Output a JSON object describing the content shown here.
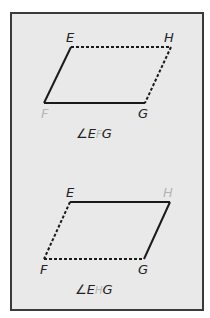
{
  "figures": [
    {
      "vertices": {
        "E": {
          "label": "E",
          "x": 71,
          "y": 47
        },
        "H": {
          "label": "H",
          "x": 171,
          "y": 47
        },
        "F": {
          "label": "F",
          "x": 44,
          "y": 103
        },
        "G": {
          "label": "G",
          "x": 145,
          "y": 103
        }
      },
      "solid_sides": [
        "EF",
        "FG"
      ],
      "dashed_sides": [
        "EH",
        "HG"
      ],
      "faded_vertex": "F",
      "angle_label": {
        "symbol": "∠",
        "first": "E",
        "vertex": "F",
        "last": "G"
      }
    },
    {
      "vertices": {
        "E": {
          "label": "E",
          "x": 70,
          "y": 202
        },
        "H": {
          "label": "H",
          "x": 170,
          "y": 202
        },
        "F": {
          "label": "F",
          "x": 44,
          "y": 259
        },
        "G": {
          "label": "G",
          "x": 144,
          "y": 259
        }
      },
      "solid_sides": [
        "EH",
        "HG"
      ],
      "dashed_sides": [
        "EF",
        "FG"
      ],
      "faded_vertex": "H",
      "angle_label": {
        "symbol": "∠",
        "first": "E",
        "vertex": "H",
        "last": "G"
      }
    }
  ],
  "colors": {
    "panel_bg": "#e9e9e9",
    "border": "#3a3a3a",
    "line": "#1a1a1a",
    "faded_label": "#b5b5b5"
  }
}
